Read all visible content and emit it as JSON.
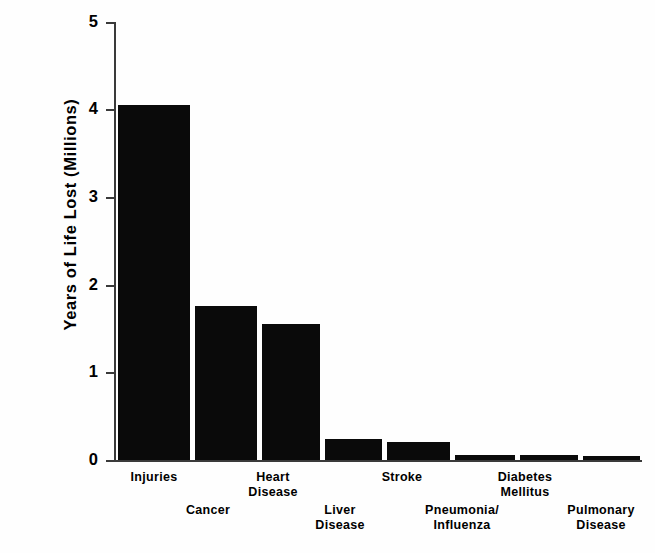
{
  "chart_data": {
    "type": "bar",
    "title": "",
    "subtitle": "",
    "xlabel": "",
    "ylabel": "Years of Life Lost (Millions)",
    "ylim": [
      0,
      5
    ],
    "yticks": [
      "0",
      "1",
      "2",
      "3",
      "4",
      "5"
    ],
    "grid": false,
    "legend": "none",
    "bar_color": "#0a0a0a",
    "categories": [
      "Injuries",
      "Cancer",
      "Heart\nDisease",
      "Liver\nDisease",
      "Stroke",
      "Pneumonia/\nInfluenza",
      "Diabetes\nMellitus",
      "Pulmonary\nDisease"
    ],
    "bars": [
      {
        "label": "Injuries",
        "value": 4.05
      },
      {
        "label": "Cancer",
        "value": 1.76
      },
      {
        "label": "Heart Disease",
        "value": 1.55
      },
      {
        "label": "Liver Disease",
        "value": 0.24
      },
      {
        "label": "Stroke",
        "value": 0.21
      },
      {
        "label": "Pneumonia/Influenza",
        "value": 0.06
      },
      {
        "label": "Diabetes Mellitus",
        "value": 0.06
      },
      {
        "label": "Pulmonary Disease",
        "value": 0.05
      }
    ],
    "values": [
      4.05,
      1.76,
      1.55,
      0.24,
      0.21,
      0.06,
      0.06,
      0.05
    ]
  },
  "axis": {
    "y_title": "Years of Life Lost (Millions)",
    "ticks": {
      "t5": "5",
      "t4": "4",
      "t3": "3",
      "t2": "2",
      "t1": "1",
      "t0": "0"
    }
  },
  "x_labels": {
    "injuries": "Injuries",
    "cancer": "Cancer",
    "heart_disease": "Heart\nDisease",
    "liver_disease": "Liver\nDisease",
    "stroke": "Stroke",
    "pneumonia_influenza": "Pneumonia/\nInfluenza",
    "diabetes_mellitus": "Diabetes\nMellitus",
    "pulmonary_disease": "Pulmonary\nDisease"
  }
}
